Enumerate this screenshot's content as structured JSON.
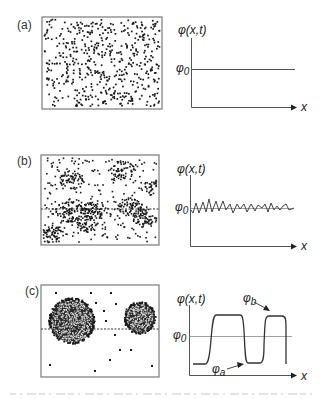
{
  "figure": {
    "panels": [
      {
        "id": "a",
        "label": "(a)",
        "description": "homogeneous mixture",
        "box": {
          "x": 42,
          "y": 17,
          "w": 120,
          "h": 92
        },
        "particles": {
          "type": "uniform",
          "count": 520,
          "seed": 11
        },
        "dashed_line": null,
        "graph": {
          "ylabel": "φ(x,t)",
          "xlabel": "x",
          "phi0_label": "φ",
          "phi0_sub": "0",
          "profile": "flat"
        }
      },
      {
        "id": "b",
        "label": "(b)",
        "description": "early-stage phase separation with small clusters",
        "box": {
          "x": 41,
          "y": 155,
          "w": 118,
          "h": 90
        },
        "particles": {
          "type": "clustered",
          "background_count": 230,
          "seed": 23,
          "clusters": [
            {
              "cx": 72,
              "cy": 180,
              "r": 11,
              "n": 60
            },
            {
              "cx": 123,
              "cy": 170,
              "r": 11,
              "n": 55
            },
            {
              "cx": 150,
              "cy": 187,
              "r": 10,
              "n": 45
            },
            {
              "cx": 69,
              "cy": 212,
              "r": 13,
              "n": 85
            },
            {
              "cx": 95,
              "cy": 210,
              "r": 11,
              "n": 70
            },
            {
              "cx": 88,
              "cy": 224,
              "r": 10,
              "n": 55
            },
            {
              "cx": 130,
              "cy": 207,
              "r": 11,
              "n": 70
            },
            {
              "cx": 145,
              "cy": 219,
              "r": 11,
              "n": 65
            },
            {
              "cx": 53,
              "cy": 236,
              "r": 12,
              "n": 75
            }
          ]
        },
        "dashed_line": {
          "y": 209
        },
        "graph": {
          "ylabel": "φ(x,t)",
          "xlabel": "x",
          "phi0_label": "φ",
          "phi0_sub": "0",
          "profile": "noisy"
        }
      },
      {
        "id": "c",
        "label": "(c)",
        "description": "late-stage coarsening with two large domains",
        "box": {
          "x": 41,
          "y": 285,
          "w": 118,
          "h": 92
        },
        "particles": {
          "type": "domains",
          "seed": 37,
          "domains": [
            {
              "cx": 72,
              "cy": 321,
              "r": 22,
              "n": 620
            },
            {
              "cx": 140,
              "cy": 318,
              "r": 15,
              "n": 300
            }
          ],
          "sparse_points": [
            [
              56,
              293
            ],
            [
              91,
              293
            ],
            [
              111,
              293
            ],
            [
              76,
              299
            ],
            [
              96,
              303
            ],
            [
              116,
              304
            ],
            [
              56,
              314
            ],
            [
              104,
              311
            ],
            [
              94,
              317
            ],
            [
              106,
              321
            ],
            [
              115,
              335
            ],
            [
              120,
              350
            ],
            [
              131,
              350
            ],
            [
              110,
              360
            ],
            [
              50,
              365
            ],
            [
              95,
              371
            ],
            [
              152,
              366
            ]
          ]
        },
        "dashed_line": {
          "y": 329
        },
        "graph": {
          "ylabel": "φ(x,t)",
          "xlabel": "x",
          "phi0_label": "φ",
          "phi0_sub": "0",
          "phia_label": "φ",
          "phia_sub": "a",
          "phib_label": "φ",
          "phib_sub": "b",
          "profile": "domains"
        }
      }
    ],
    "colors": {
      "ink": "#1a1a1a",
      "frame": "#7a7a7a",
      "axis": "#555555",
      "reference_line": "#8a8a8a",
      "background": "#ffffff"
    }
  },
  "chart_data": [
    {
      "type": "line",
      "title": "(a)",
      "xlabel": "x",
      "ylabel": "φ(x,t)",
      "reference": "φ_0",
      "series": [
        {
          "name": "φ(x,t)",
          "x": [
            0,
            1
          ],
          "values": [
            0.5,
            0.5
          ]
        }
      ],
      "ylim": [
        0,
        1
      ]
    },
    {
      "type": "line",
      "title": "(b)",
      "xlabel": "x",
      "ylabel": "φ(x,t)",
      "reference": "φ_0",
      "series": [
        {
          "name": "φ(x,t)",
          "x": [
            0,
            0.03,
            0.07,
            0.1,
            0.14,
            0.17,
            0.2,
            0.24,
            0.28,
            0.31,
            0.35,
            0.39,
            0.43,
            0.47,
            0.51,
            0.55,
            0.6,
            0.64,
            0.68,
            0.72,
            0.75,
            0.78,
            0.81,
            0.84,
            0.87,
            0.9,
            0.93,
            0.96,
            1.0
          ],
          "values": [
            0.5,
            0.42,
            0.6,
            0.45,
            0.62,
            0.44,
            0.63,
            0.46,
            0.6,
            0.47,
            0.58,
            0.43,
            0.57,
            0.47,
            0.56,
            0.44,
            0.55,
            0.44,
            0.56,
            0.48,
            0.57,
            0.45,
            0.52,
            0.47,
            0.52,
            0.45,
            0.49,
            0.56,
            0.47
          ]
        }
      ],
      "ylim": [
        0,
        1
      ]
    },
    {
      "type": "line",
      "title": "(c)",
      "xlabel": "x",
      "ylabel": "φ(x,t)",
      "reference": "φ_0",
      "annotations": [
        "φ_a (low plateau)",
        "φ_b (high plateau)"
      ],
      "series": [
        {
          "name": "φ(x,t)",
          "x": [
            0,
            0.1,
            0.17,
            0.2,
            0.4,
            0.45,
            0.63,
            0.7,
            0.72,
            0.85,
            0.87,
            0.97
          ],
          "values": [
            0.15,
            0.15,
            0.3,
            0.85,
            0.85,
            0.17,
            0.17,
            0.2,
            0.85,
            0.85,
            0.8,
            0.05
          ]
        }
      ],
      "ylim": [
        0,
        1
      ]
    }
  ]
}
